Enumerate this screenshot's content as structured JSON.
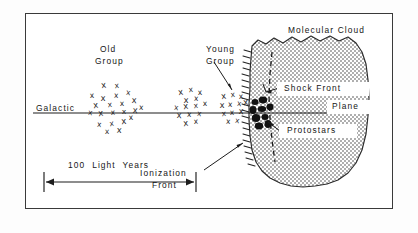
{
  "figure": {
    "domain_type": "diagram",
    "labels": {
      "old_group_line1": "Old",
      "old_group_line2": "Group",
      "young_group_line1": "Young",
      "young_group_line2": "Group",
      "galactic": "Galactic",
      "plane": "Plane",
      "molecular_cloud": "Molecular Cloud",
      "shock_front": "Shock Front",
      "protostars": "Protostars",
      "ionization_front_line1": "Ionization",
      "ionization_front_line2": "Front",
      "scale_bar": "100  Light  Years"
    },
    "colors": {
      "ink": "#161616",
      "frame": "#3a3a3a",
      "cloud_fill": "#d9d9d9",
      "cloud_edge": "#2b2b2b",
      "paper": "#ffffff"
    },
    "star_clusters": [
      {
        "name": "old-group",
        "age": "oldest",
        "marker": "x",
        "count": 22,
        "points": [
          [
            104,
            88
          ],
          [
            117,
            88
          ],
          [
            92,
            98
          ],
          [
            103,
            101
          ],
          [
            116,
            98
          ],
          [
            128,
            95
          ],
          [
            96,
            108
          ],
          [
            110,
            107
          ],
          [
            122,
            106
          ],
          [
            134,
            103
          ],
          [
            141,
            110
          ],
          [
            90,
            115
          ],
          [
            101,
            116
          ],
          [
            113,
            115
          ],
          [
            124,
            114
          ],
          [
            135,
            113
          ],
          [
            99,
            127
          ],
          [
            112,
            126
          ],
          [
            124,
            124
          ],
          [
            131,
            120
          ],
          [
            107,
            134
          ],
          [
            119,
            133
          ]
        ]
      },
      {
        "name": "middle-group",
        "age": "intermediate",
        "marker": "x",
        "count": 14,
        "points": [
          [
            181,
            95
          ],
          [
            191,
            92
          ],
          [
            200,
            95
          ],
          [
            186,
            103
          ],
          [
            196,
            101
          ],
          [
            176,
            110
          ],
          [
            186,
            109
          ],
          [
            196,
            108
          ],
          [
            205,
            106
          ],
          [
            179,
            118
          ],
          [
            189,
            117
          ],
          [
            199,
            116
          ],
          [
            186,
            126
          ],
          [
            196,
            124
          ]
        ]
      },
      {
        "name": "young-group",
        "age": "youngest",
        "marker": "x",
        "count": 12,
        "points": [
          [
            224,
            99
          ],
          [
            233,
            97
          ],
          [
            241,
            99
          ],
          [
            222,
            108
          ],
          [
            230,
            107
          ],
          [
            239,
            106
          ],
          [
            246,
            105
          ],
          [
            224,
            116
          ],
          [
            232,
            115
          ],
          [
            241,
            114
          ],
          [
            228,
            124
          ],
          [
            237,
            123
          ]
        ]
      }
    ],
    "protostars": {
      "marker": "filled-dot",
      "count": 9,
      "points": [
        [
          255,
          102
        ],
        [
          263,
          100
        ],
        [
          253,
          110
        ],
        [
          262,
          109
        ],
        [
          270,
          107
        ],
        [
          256,
          118
        ],
        [
          265,
          117
        ],
        [
          259,
          126
        ],
        [
          268,
          124
        ]
      ]
    },
    "scale": {
      "value": 100,
      "unit": "Light Years",
      "x_start": 44,
      "x_end": 196,
      "y": 182
    },
    "galactic_plane_line": {
      "y": 113,
      "x_start": 33,
      "x_end": 355
    }
  }
}
